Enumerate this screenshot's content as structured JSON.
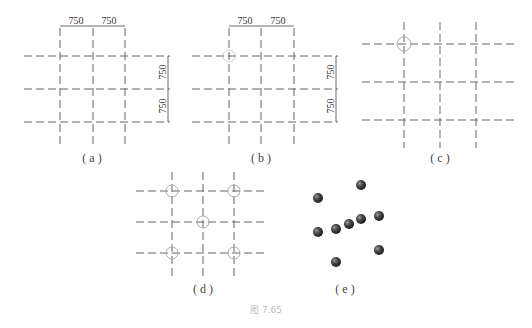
{
  "figure": {
    "caption": "图 7.65",
    "panels": [
      {
        "id": "a",
        "label": "( a )",
        "dimensions": {
          "horizontal": [
            "750",
            "750"
          ],
          "vertical": [
            "750",
            "750"
          ]
        },
        "highlights": []
      },
      {
        "id": "b",
        "label": "( b )",
        "dimensions": {
          "horizontal": [
            "750",
            "750"
          ],
          "vertical": [
            "750",
            "750"
          ]
        },
        "highlights": [
          "top-left-faint"
        ]
      },
      {
        "id": "c",
        "label": "( c )",
        "highlights": [
          "top-left"
        ]
      },
      {
        "id": "d",
        "label": "( d )",
        "highlights": [
          "top-left",
          "top-right",
          "center",
          "bottom-left",
          "bottom-right"
        ]
      },
      {
        "id": "e",
        "label": "( e )",
        "spheres": 9
      }
    ]
  },
  "colors": {
    "grid": "#666666",
    "sphere": "#3a3a3a",
    "highlight": "#aaaaaa"
  }
}
